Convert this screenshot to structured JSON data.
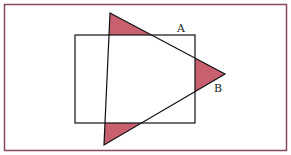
{
  "diagram": {
    "labels": {
      "a": "A",
      "b": "B"
    },
    "colors": {
      "frame": "#8a4a5a",
      "shade": "#c86070",
      "stroke": "#111111"
    },
    "frame": {
      "x": 4,
      "y": 4,
      "w": 283,
      "h": 147
    },
    "rectangle": {
      "x": 75,
      "y": 35,
      "w": 120,
      "h": 88
    },
    "triangle": [
      [
        110,
        13
      ],
      [
        225,
        74
      ],
      [
        104,
        145
      ]
    ]
  }
}
